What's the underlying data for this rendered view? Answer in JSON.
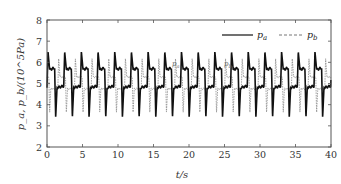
{
  "chart_data": {
    "type": "line",
    "title": "",
    "xlabel": "t/s",
    "ylabel": "p_a, p_b/(10^5Pa)",
    "xlim": [
      0,
      40
    ],
    "ylim": [
      2,
      8
    ],
    "xticks": [
      0,
      5,
      10,
      15,
      20,
      25,
      30,
      35,
      40
    ],
    "yticks": [
      2,
      3,
      4,
      5,
      6,
      7,
      8
    ],
    "grid": false,
    "legend_position": "top-right",
    "period_s": 2.35,
    "series": [
      {
        "name": "p_a",
        "style": "solid",
        "color": "#111111",
        "description": "Square-like oscillation alternating between plateaus ~4.7-5.0 and ~5.5-5.8, with overshoot peak ~6.4-6.6 at each rising edge and undershoot trough ~3.3-3.5 at each falling edge",
        "low_plateau": 4.8,
        "high_plateau": 5.65,
        "peak": 6.5,
        "trough": 3.4
      },
      {
        "name": "p_b",
        "style": "dashed",
        "color": "#888888",
        "description": "Anti-phase oscillation to p_a, plateaus ~4.7-5.0 and ~5.1-5.5, peak ~6.1-6.3, trough ~3.5-3.7",
        "low_plateau": 4.75,
        "high_plateau": 5.3,
        "peak": 6.2,
        "trough": 3.6
      }
    ],
    "annotations": [
      "p_a",
      "p_b"
    ]
  },
  "legend": {
    "items": [
      {
        "label": "p_a",
        "sub": "a",
        "base": "p"
      },
      {
        "label": "p_b",
        "sub": "b",
        "base": "p"
      }
    ]
  },
  "axes": {
    "x_label_text": "t/s",
    "y_label_text": "p_a, p_b/(10^5Pa)",
    "x_tick_labels": [
      "0",
      "5",
      "10",
      "15",
      "20",
      "25",
      "30",
      "35",
      "40"
    ],
    "y_tick_labels": [
      "2",
      "3",
      "4",
      "5",
      "6",
      "7",
      "8"
    ]
  }
}
